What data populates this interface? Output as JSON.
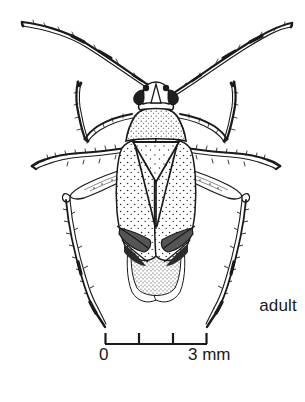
{
  "figure": {
    "kind": "scientific-line-illustration",
    "background_color": "#ffffff",
    "ink_color": "#1a1a1a"
  },
  "labels": {
    "stage": "adult",
    "scale_zero": "0",
    "scale_max": "3 mm"
  },
  "scale_bar": {
    "unit": "mm",
    "min": 0,
    "max": 3,
    "tick_values": [
      0,
      1,
      2,
      3
    ],
    "tick_x_px": [
      105,
      139,
      173,
      207
    ],
    "baseline_y_px": 344,
    "tick_height_px": 11
  },
  "anatomy": {
    "parts": [
      "antenna-left",
      "antenna-right",
      "head",
      "compound-eye-left",
      "compound-eye-right",
      "pronotum",
      "scutellum",
      "hemelytron-left",
      "hemelytron-right",
      "clavus",
      "corium",
      "cuneus",
      "membrane",
      "foreleg-left",
      "foreleg-right",
      "midleg-left",
      "midleg-right",
      "hindleg-left",
      "hindleg-right"
    ]
  }
}
